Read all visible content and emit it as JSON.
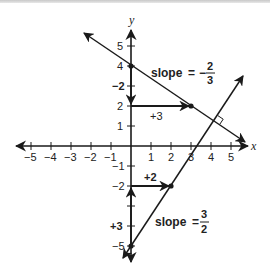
{
  "diagram": {
    "axes": {
      "x_label": "x",
      "y_label": "y",
      "x_ticks": [
        "−5",
        "−4",
        "−3",
        "−2",
        "−1",
        "1",
        "2",
        "3",
        "4",
        "5"
      ],
      "y_ticks_pos": [
        "5",
        "4",
        "2",
        "1"
      ],
      "y_ticks_neg": [
        "−1",
        "−2",
        "−5"
      ]
    },
    "line1": {
      "slope_word": "slope",
      "equals": "=",
      "sign": "−",
      "numerator": "2",
      "denominator": "3",
      "y_intercept": "(0, 4)",
      "point": "(3, 2)",
      "rise_label": "−2",
      "run_label": "+3"
    },
    "line2": {
      "slope_word": "slope",
      "equals": "=",
      "numerator": "3",
      "denominator": "2",
      "y_intercept": "(0, −5)",
      "point": "(2, −2)",
      "rise_label": "+3",
      "run_label": "+2"
    },
    "right_angle_marker": "perpendicular",
    "colors": {
      "ink": "#1a1a1a",
      "background": "#ffffff"
    }
  }
}
